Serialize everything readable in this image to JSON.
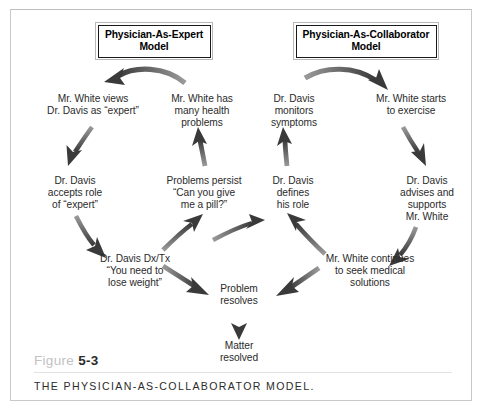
{
  "figure": {
    "number_word": "Figure",
    "number": "5-3",
    "title": "THE PHYSICIAN-AS-COLLABORATOR MODEL."
  },
  "headers": {
    "left_model": "Physician-As-Expert\nModel",
    "right_model": "Physician-As-Collaborator\nModel"
  },
  "nodes": {
    "white_views": "Mr. White views\nDr. Davis as “expert”",
    "white_has": "Mr. White  has\nmany health\nproblems",
    "davis_monitors": "Dr. Davis\nmonitors\nsymptoms",
    "white_starts": "Mr. White starts\nto exercise",
    "davis_accepts": "Dr. Davis\naccepts role\nof “expert”",
    "problems_persist": "Problems persist\n“Can you give\nme a pill?”",
    "davis_defines": "Dr. Davis\ndefines\nhis role",
    "davis_advises": "Dr. Davis\nadvises and\nsupports\nMr. White",
    "davis_dxtx": "Dr. Davis Dx/Tx\n“You need to\nlose weight”",
    "white_continues": "Mr. White continues\nto seek medical\nsolutions",
    "problem_resolves": "Problem\nresolves",
    "matter_resolved": "Matter\nresolved"
  },
  "colors": {
    "arrow_dark": "#3a3a3a",
    "arrow_light": "#8d8d8d",
    "text": "#2b2b2b",
    "frame": "#c9c9c9",
    "figure_word": "#c2c2c2"
  }
}
